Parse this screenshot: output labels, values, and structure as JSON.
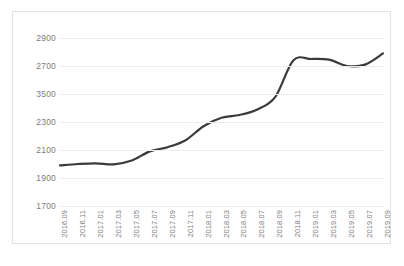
{
  "chart_data": {
    "type": "line",
    "title": "",
    "subtitle": "",
    "xlabel": "",
    "ylabel": "",
    "grid": true,
    "legend": false,
    "legend_position": "none",
    "line_color": "#3a3a3a",
    "gridline_color": "#ededed",
    "axis_text_color": "#7c7c7c",
    "border_color": "#e3e3e3",
    "background_color": "#ffffff",
    "ytick_labels": [
      "2900",
      "2700",
      "3500",
      "2300",
      "2100",
      "1900",
      "1700"
    ],
    "ytick_values": [
      2900,
      2700,
      2500,
      2300,
      2100,
      1900,
      1700
    ],
    "ylim": [
      1700,
      2900
    ],
    "categories": [
      "2016.09",
      "2016.11",
      "2017.01",
      "2017.03",
      "2017.05",
      "2017.07",
      "2017.09",
      "2017.11",
      "2018.01",
      "2018.03",
      "2018.05",
      "2018.07",
      "2018.09",
      "2018.11",
      "2019.01",
      "2019.03",
      "2019.05",
      "2019.07",
      "2019.09"
    ],
    "values": [
      1990,
      2000,
      2005,
      1998,
      2025,
      2090,
      2120,
      2170,
      2270,
      2330,
      2350,
      2390,
      2480,
      2740,
      2750,
      2745,
      2700,
      2710,
      2790
    ]
  }
}
